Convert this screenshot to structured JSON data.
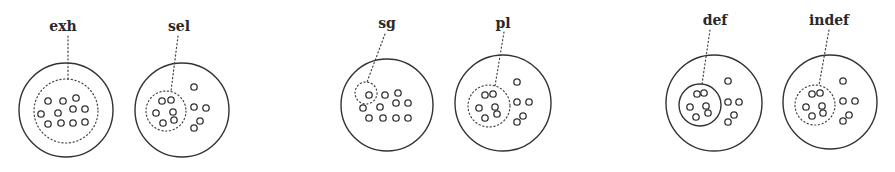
{
  "figure": {
    "panels": [
      {
        "id": "exh",
        "label": "exh",
        "label_pos": [
          63,
          31
        ],
        "outer": {
          "cx": 66,
          "cy": 110,
          "r": 47
        },
        "inner": {
          "type": "dotted",
          "cx": 66,
          "cy": 111,
          "r": 32
        },
        "pointer": [
          [
            68,
            36
          ],
          [
            68,
            79
          ]
        ],
        "elements": [
          [
            48,
            101
          ],
          [
            63,
            101
          ],
          [
            76,
            98
          ],
          [
            41,
            114
          ],
          [
            58,
            113
          ],
          [
            73,
            109
          ],
          [
            85,
            109
          ],
          [
            48,
            124
          ],
          [
            61,
            123
          ],
          [
            73,
            123
          ],
          [
            85,
            122
          ]
        ]
      },
      {
        "id": "sel",
        "label": "sel",
        "label_pos": [
          179,
          31
        ],
        "outer": {
          "cx": 182,
          "cy": 110,
          "r": 47
        },
        "inner": {
          "type": "dotted",
          "cx": 166,
          "cy": 111,
          "r": 20
        },
        "pointer": [
          [
            178,
            36
          ],
          [
            171,
            91
          ]
        ],
        "elements": [
          [
            162,
            101
          ],
          [
            171,
            100
          ],
          [
            156,
            113
          ],
          [
            173,
            112
          ],
          [
            174,
            120
          ],
          [
            163,
            123
          ],
          [
            194,
            87
          ],
          [
            194,
            107
          ],
          [
            206,
            108
          ],
          [
            200,
            121
          ],
          [
            194,
            128
          ]
        ]
      },
      {
        "id": "sg",
        "label": "sg",
        "label_pos": [
          387,
          28
        ],
        "outer": {
          "cx": 387,
          "cy": 105,
          "r": 46
        },
        "inner": {
          "type": "dotted",
          "cx": 366,
          "cy": 93,
          "r": 11
        },
        "pointer": [
          [
            385,
            34
          ],
          [
            367,
            82
          ]
        ],
        "elements": [
          [
            369,
            95
          ],
          [
            385,
            95
          ],
          [
            398,
            93
          ],
          [
            363,
            108
          ],
          [
            380,
            107
          ],
          [
            396,
            103
          ],
          [
            408,
            103
          ],
          [
            369,
            118
          ],
          [
            383,
            118
          ],
          [
            396,
            118
          ],
          [
            408,
            118
          ]
        ]
      },
      {
        "id": "pl",
        "label": "pl",
        "label_pos": [
          503,
          28
        ],
        "outer": {
          "cx": 503,
          "cy": 103,
          "r": 48
        },
        "inner": {
          "type": "dotted",
          "cx": 489,
          "cy": 106,
          "r": 21
        },
        "pointer": [
          [
            504,
            32
          ],
          [
            495,
            86
          ]
        ],
        "elements": [
          [
            485,
            95
          ],
          [
            493,
            94
          ],
          [
            479,
            108
          ],
          [
            495,
            107
          ],
          [
            497,
            114
          ],
          [
            485,
            118
          ],
          [
            517,
            82
          ],
          [
            517,
            102
          ],
          [
            529,
            102
          ],
          [
            523,
            116
          ],
          [
            517,
            122
          ]
        ]
      },
      {
        "id": "def",
        "label": "def",
        "label_pos": [
          715,
          25
        ],
        "outer": {
          "cx": 714,
          "cy": 103,
          "r": 48
        },
        "inner": {
          "type": "solid",
          "cx": 700,
          "cy": 105,
          "r": 21
        },
        "pointer": [
          [
            710,
            30
          ],
          [
            702,
            84
          ]
        ],
        "elements": [
          [
            697,
            94
          ],
          [
            704,
            93
          ],
          [
            690,
            107
          ],
          [
            706,
            106
          ],
          [
            708,
            113
          ],
          [
            696,
            117
          ],
          [
            728,
            81
          ],
          [
            728,
            102
          ],
          [
            739,
            102
          ],
          [
            734,
            115
          ],
          [
            728,
            122
          ]
        ]
      },
      {
        "id": "indef",
        "label": "indef",
        "label_pos": [
          829,
          25
        ],
        "outer": {
          "cx": 830,
          "cy": 102,
          "r": 47
        },
        "inner": {
          "type": "dotted",
          "cx": 815,
          "cy": 105,
          "r": 20
        },
        "pointer": [
          [
            829,
            30
          ],
          [
            819,
            85
          ]
        ],
        "elements": [
          [
            812,
            94
          ],
          [
            820,
            93
          ],
          [
            806,
            107
          ],
          [
            822,
            106
          ],
          [
            823,
            113
          ],
          [
            812,
            116
          ],
          [
            843,
            81
          ],
          [
            843,
            101
          ],
          [
            855,
            101
          ],
          [
            849,
            115
          ],
          [
            843,
            121
          ]
        ]
      }
    ],
    "element_radius": 3.2,
    "colors": {
      "stroke": "#333333",
      "background": "#ffffff"
    }
  }
}
